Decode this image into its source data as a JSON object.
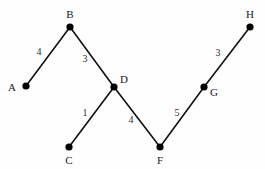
{
  "figure": {
    "background_color": "#fefefe",
    "edge_color": "#111111",
    "node_color": "#000000",
    "text_color": "#1a1a1a",
    "width": 265,
    "height": 169
  },
  "chart_data": {
    "type": "diagram",
    "title": "",
    "xlabel": "",
    "ylabel": "",
    "graph_kind": "weighted-undirected-graph",
    "nodes": [
      {
        "id": "A",
        "label": "A",
        "x": 26,
        "y": 86,
        "label_x": 12,
        "label_y": 87
      },
      {
        "id": "B",
        "label": "B",
        "x": 70,
        "y": 27,
        "label_x": 70,
        "label_y": 14
      },
      {
        "id": "C",
        "label": "C",
        "x": 69,
        "y": 147,
        "label_x": 69,
        "label_y": 160
      },
      {
        "id": "D",
        "label": "D",
        "x": 114,
        "y": 87,
        "label_x": 124,
        "label_y": 79
      },
      {
        "id": "F",
        "label": "F",
        "x": 160,
        "y": 147,
        "label_x": 160,
        "label_y": 160
      },
      {
        "id": "G",
        "label": "G",
        "x": 204,
        "y": 87,
        "label_x": 214,
        "label_y": 92
      },
      {
        "id": "H",
        "label": "H",
        "x": 250,
        "y": 27,
        "label_x": 250,
        "label_y": 14
      }
    ],
    "edges": [
      {
        "from": "A",
        "to": "B",
        "weight": "4",
        "label_x": 39,
        "label_y": 52
      },
      {
        "from": "B",
        "to": "D",
        "weight": "3",
        "label_x": 85,
        "label_y": 59
      },
      {
        "from": "C",
        "to": "D",
        "weight": "1",
        "label_x": 85,
        "label_y": 113
      },
      {
        "from": "D",
        "to": "F",
        "weight": "4",
        "label_x": 131,
        "label_y": 120
      },
      {
        "from": "F",
        "to": "G",
        "weight": "5",
        "label_x": 177,
        "label_y": 113
      },
      {
        "from": "G",
        "to": "H",
        "weight": "3",
        "label_x": 218,
        "label_y": 53
      }
    ]
  }
}
